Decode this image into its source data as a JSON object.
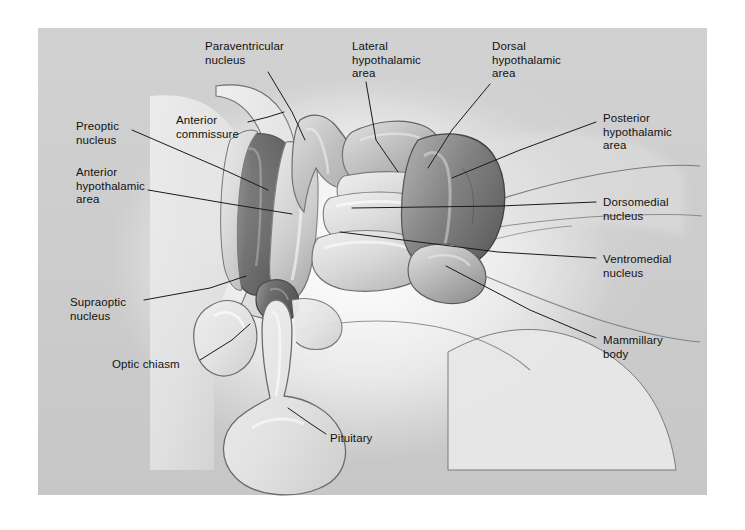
{
  "figure": {
    "style": "grayscale airbrush medical illustration on grey plate",
    "plate_color": "#cfcfcf",
    "page_color": "#ffffff",
    "line_color": "#1a1a1a",
    "label_text_color": "#121212"
  },
  "labels": [
    {
      "id": "paraventricular-nucleus",
      "text": "Paraventricular\nnucleus",
      "x": 205,
      "y": 40,
      "leader": [
        [
          268,
          72
        ],
        [
          292,
          112
        ],
        [
          305,
          140
        ]
      ]
    },
    {
      "id": "lateral-hypothalamic-area",
      "text": "Lateral\nhypothalamic\narea",
      "x": 352,
      "y": 40,
      "leader": [
        [
          366,
          82
        ],
        [
          376,
          140
        ],
        [
          398,
          172
        ]
      ]
    },
    {
      "id": "dorsal-hypothalamic-area",
      "text": "Dorsal\nhypothalamic\narea",
      "x": 492,
      "y": 40,
      "leader": [
        [
          490,
          84
        ],
        [
          452,
          130
        ],
        [
          428,
          168
        ]
      ]
    },
    {
      "id": "posterior-hypothalamic-area",
      "text": "Posterior\nhypothalamic\narea",
      "x": 603,
      "y": 112,
      "leader": [
        [
          596,
          122
        ],
        [
          520,
          150
        ],
        [
          452,
          178
        ]
      ]
    },
    {
      "id": "preoptic-nucleus",
      "text": "Preoptic\nnucleus",
      "x": 76,
      "y": 120,
      "leader": [
        [
          132,
          130
        ],
        [
          220,
          168
        ],
        [
          268,
          190
        ]
      ]
    },
    {
      "id": "anterior-commissure",
      "text": "Anterior\ncommissure",
      "x": 176,
      "y": 114,
      "leader": [
        [
          248,
          122
        ],
        [
          268,
          117
        ],
        [
          284,
          112
        ]
      ]
    },
    {
      "id": "anterior-hypothalamic-area",
      "text": "Anterior\nhypothalamic\narea",
      "x": 76,
      "y": 166,
      "leader": [
        [
          148,
          190
        ],
        [
          230,
          204
        ],
        [
          292,
          214
        ]
      ]
    },
    {
      "id": "dorsomedial-nucleus",
      "text": "Dorsomedial\nnucleus",
      "x": 603,
      "y": 196,
      "leader": [
        [
          596,
          202
        ],
        [
          500,
          206
        ],
        [
          352,
          208
        ]
      ]
    },
    {
      "id": "ventromedial-nucleus",
      "text": "Ventromedial\nnucleus",
      "x": 603,
      "y": 253,
      "leader": [
        [
          596,
          258
        ],
        [
          498,
          252
        ],
        [
          340,
          232
        ]
      ]
    },
    {
      "id": "mammillary-body",
      "text": "Mammillary\nbody",
      "x": 603,
      "y": 334,
      "leader": [
        [
          596,
          338
        ],
        [
          530,
          310
        ],
        [
          446,
          266
        ]
      ]
    },
    {
      "id": "supraoptic-nucleus",
      "text": "Supraoptic\nnucleus",
      "x": 70,
      "y": 296,
      "leader": [
        [
          144,
          300
        ],
        [
          210,
          288
        ],
        [
          246,
          276
        ]
      ]
    },
    {
      "id": "optic-chiasm",
      "text": "Optic chiasm",
      "x": 112,
      "y": 358,
      "leader": [
        [
          200,
          360
        ],
        [
          232,
          340
        ],
        [
          250,
          324
        ]
      ]
    },
    {
      "id": "pituitary",
      "text": "Pituitary",
      "x": 330,
      "y": 432,
      "leader": [
        [
          326,
          434
        ],
        [
          308,
          422
        ],
        [
          288,
          408
        ]
      ]
    }
  ],
  "structures": [
    {
      "id": "anterior-commissure-body",
      "tone": "light"
    },
    {
      "id": "preoptic-nucleus-body",
      "tone": "dark"
    },
    {
      "id": "anterior-hypothalamic-area-body",
      "tone": "mid-light"
    },
    {
      "id": "paraventricular-nucleus-body",
      "tone": "mid"
    },
    {
      "id": "dorsal-hypothalamic-area-body",
      "tone": "mid"
    },
    {
      "id": "lateral-hypothalamic-area-body",
      "tone": "light"
    },
    {
      "id": "dorsomedial-nucleus-body",
      "tone": "light"
    },
    {
      "id": "ventromedial-nucleus-body",
      "tone": "light"
    },
    {
      "id": "posterior-hypothalamic-area-body",
      "tone": "dark"
    },
    {
      "id": "mammillary-body-body",
      "tone": "mid"
    },
    {
      "id": "supraoptic-nucleus-body",
      "tone": "dark"
    },
    {
      "id": "optic-chiasm-body",
      "tone": "pale"
    },
    {
      "id": "pituitary-stalk",
      "tone": "pale"
    },
    {
      "id": "pituitary-gland",
      "tone": "pale"
    },
    {
      "id": "brainstem-pons",
      "tone": "pale"
    },
    {
      "id": "corpus-callosum-septum",
      "tone": "pale"
    }
  ]
}
